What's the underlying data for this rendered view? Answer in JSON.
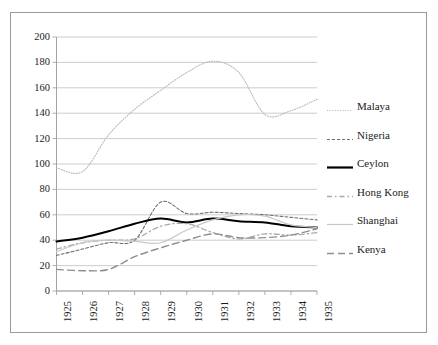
{
  "chart_data": {
    "type": "line",
    "title": "",
    "xlabel": "",
    "ylabel": "",
    "grid": true,
    "legend_position": "right",
    "x": [
      1925,
      1926,
      1927,
      1928,
      1929,
      1930,
      1931,
      1932,
      1933,
      1934,
      1935
    ],
    "categories": [
      "1925",
      "1926",
      "1927",
      "1928",
      "1929",
      "1930",
      "1931",
      "1932",
      "1933",
      "1934",
      "1935"
    ],
    "xlim": [
      1925,
      1935
    ],
    "ylim": [
      0,
      200
    ],
    "yticks": [
      0,
      20,
      40,
      60,
      80,
      100,
      120,
      140,
      160,
      180,
      200
    ],
    "ytick_labels": [
      "0",
      "20",
      "40",
      "60",
      "80",
      "100",
      "120",
      "140",
      "160",
      "180",
      "200"
    ],
    "series": [
      {
        "name": "Malaya",
        "style": "dotted",
        "color": "#b8b8b8",
        "width": 1.1,
        "values": [
          97,
          94,
          123,
          143,
          158,
          172,
          181,
          172,
          139,
          142,
          151
        ]
      },
      {
        "name": "Nigeria",
        "style": "dashed",
        "color": "#6e6e6e",
        "width": 1.1,
        "values": [
          28,
          33,
          38,
          40,
          70,
          61,
          62,
          61,
          60,
          58,
          56
        ]
      },
      {
        "name": "Ceylon",
        "style": "solid",
        "color": "#000000",
        "width": 2.0,
        "values": [
          39,
          42,
          47,
          53,
          57,
          54,
          57,
          55,
          54,
          51,
          50
        ]
      },
      {
        "name": "Hong Kong",
        "style": "dashdot",
        "color": "#a9a9a9",
        "width": 1.3,
        "values": [
          33,
          38,
          40,
          41,
          51,
          53,
          46,
          41,
          45,
          44,
          46
        ]
      },
      {
        "name": "Shanghai",
        "style": "solid",
        "color": "#c9c9c9",
        "width": 1.2,
        "values": [
          31,
          38,
          40,
          39,
          38,
          48,
          56,
          60,
          59,
          52,
          50
        ]
      },
      {
        "name": "Kenya",
        "style": "longdash",
        "color": "#8e8e8e",
        "width": 1.4,
        "values": [
          17,
          16,
          17,
          27,
          34,
          40,
          45,
          42,
          42,
          44,
          49
        ]
      }
    ]
  },
  "legend": {
    "items": [
      {
        "label": "Malaya"
      },
      {
        "label": "Nigeria"
      },
      {
        "label": "Ceylon"
      },
      {
        "label": "Hong Kong"
      },
      {
        "label": "Shanghai"
      },
      {
        "label": "Kenya"
      }
    ]
  },
  "axes": {
    "gridline_color": "#c0c0c0",
    "axis_color": "#9a9a9a",
    "border_color": "#9a9a9a"
  }
}
